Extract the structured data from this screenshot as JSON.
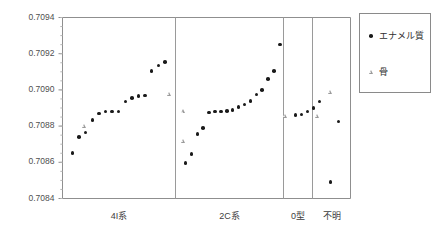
{
  "axes": {
    "ylabel_main": "Sr同位体比",
    "ylabel_ratio_prefix": "87",
    "ylabel_ratio_mid": "Sr/",
    "ylabel_ratio_suffix": "86",
    "ylabel_ratio_end": "Sr",
    "ytick_labels": [
      "0.7094",
      "0.7092",
      "0.7090",
      "0.7088",
      "0.7086",
      "0.7084"
    ],
    "group_labels": [
      "4I系",
      "2C系",
      "0型",
      "不明"
    ]
  },
  "legend": {
    "items": [
      {
        "label": "エナメル質",
        "marker": "filled-circle-marker"
      },
      {
        "label": "骨",
        "marker": "open-triangle-marker"
      }
    ]
  },
  "chart_data": {
    "type": "scatter",
    "title": "",
    "xlabel": "",
    "ylabel": "Sr同位体比 87Sr/86Sr",
    "ylim": [
      0.7084,
      0.7094
    ],
    "ytick_step": 0.0002,
    "yminor_step": 5e-05,
    "grid": false,
    "legend_position": "right-outside",
    "groups": [
      {
        "name": "4I系",
        "series": [
          {
            "name": "エナメル質",
            "marker": "filled-circle",
            "values": [
              0.70865,
              0.70874,
              0.708765,
              0.708835,
              0.70887,
              0.70888,
              0.70888,
              0.70888,
              0.708935,
              0.708955,
              0.708965,
              0.70897,
              0.709105,
              0.709135,
              0.709155
            ]
          },
          {
            "name": "骨",
            "marker": "open-triangle",
            "values": [
              0.7088,
              0.708975
            ]
          }
        ]
      },
      {
        "name": "2C系",
        "series": [
          {
            "name": "エナメル質",
            "marker": "filled-circle",
            "values": [
              0.708595,
              0.708645,
              0.708755,
              0.70879,
              0.708875,
              0.70888,
              0.70888,
              0.708885,
              0.70889,
              0.708905,
              0.70892,
              0.70894,
              0.708975,
              0.709,
              0.70906,
              0.709105,
              0.70925
            ]
          },
          {
            "name": "骨",
            "marker": "open-triangle",
            "values": [
              0.708715,
              0.70888
            ]
          }
        ]
      },
      {
        "name": "0型",
        "series": [
          {
            "name": "エナメル質",
            "marker": "filled-circle",
            "values": [
              0.70886,
              0.708865,
              0.70888,
              0.7089,
              0.708935
            ]
          },
          {
            "name": "骨",
            "marker": "open-triangle",
            "values": [
              0.708855
            ]
          }
        ]
      },
      {
        "name": "不明",
        "series": [
          {
            "name": "エナメル質",
            "marker": "filled-circle",
            "values": [
              0.70849,
              0.708825
            ]
          },
          {
            "name": "骨",
            "marker": "open-triangle",
            "values": [
              0.708855,
              0.70899
            ]
          }
        ]
      }
    ]
  }
}
